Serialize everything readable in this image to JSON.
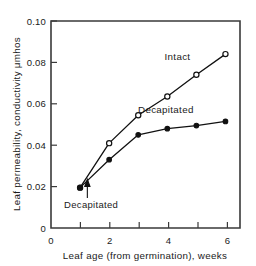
{
  "chart_data": {
    "type": "line",
    "title": "",
    "xlabel": "Leaf age (from germination), weeks",
    "ylabel": "Leaf permeability, conductivity μmhos",
    "xlim": [
      0,
      6.5
    ],
    "ylim": [
      0,
      0.1
    ],
    "grid": false,
    "legend_position": "inline-labels",
    "x_major_ticks": [
      0,
      2,
      4,
      6
    ],
    "x_major_tick_labels": [
      "0",
      "2",
      "4",
      "6"
    ],
    "x_minor_ticks": [
      1,
      3,
      5
    ],
    "y_major_ticks": [
      0,
      0.02,
      0.04,
      0.06,
      0.08,
      0.1
    ],
    "y_major_tick_labels": [
      "0",
      "0.02",
      "0.04",
      "0.06",
      "0.08",
      "0.10"
    ],
    "series": [
      {
        "name": "Intact",
        "marker": "open-circle",
        "x": [
          1,
          2,
          3,
          4,
          5,
          6
        ],
        "values": [
          0.0195,
          0.041,
          0.0545,
          0.0635,
          0.074,
          0.084
        ],
        "label_text": "Intact",
        "label_x": 4.35,
        "label_y": 0.081
      },
      {
        "name": "Decapitated",
        "marker": "filled-circle",
        "x": [
          1,
          2,
          3,
          4,
          5,
          6
        ],
        "values": [
          0.0195,
          0.033,
          0.045,
          0.048,
          0.0495,
          0.0515
        ],
        "label_text": "Decapitated",
        "label_x": 3.95,
        "label_y": 0.0555
      }
    ],
    "annotations": [
      {
        "name": "decapitation-marker",
        "text": "Decapitated",
        "arrow_tip_x": 1.25,
        "arrow_tip_y": 0.0235,
        "arrow_tail_x": 1.25,
        "arrow_tail_y": 0.0145,
        "text_x": 1.38,
        "text_y": 0.0095
      }
    ]
  },
  "axis": {
    "x_title": "Leaf age (from germination), weeks",
    "y_title": "Leaf permeability, conductivity μmhos",
    "y_labels": [
      "0.10",
      "0.08",
      "0.06",
      "0.04",
      "0.02",
      "0"
    ],
    "x_labels": [
      "0",
      "2",
      "4",
      "6"
    ]
  },
  "labels": {
    "intact": "Intact",
    "decapitated_series": "Decapitated",
    "decapitated_annotation": "Decapitated"
  },
  "colors": {
    "line": "#111111",
    "axis": "#3a3a3a",
    "background": "#ffffff"
  }
}
